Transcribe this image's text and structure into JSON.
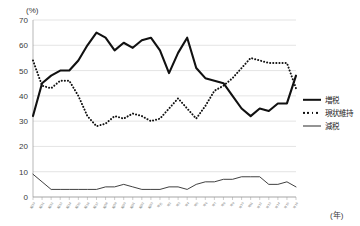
{
  "chart_data": {
    "type": "line",
    "title": "",
    "xlabel": "(年)",
    "ylabel": "(%)",
    "ylim": [
      0,
      70
    ],
    "ytick_values": [
      0,
      10,
      20,
      30,
      40,
      50,
      60,
      70
    ],
    "grid": true,
    "legend_position": "right",
    "categories": [
      "昭50",
      "昭51",
      "昭52",
      "昭53",
      "昭54",
      "昭55",
      "昭56",
      "昭57",
      "昭58",
      "昭59",
      "昭60",
      "昭61",
      "昭62",
      "昭63",
      "平元",
      "平2",
      "平3",
      "平4",
      "平5",
      "平6",
      "平7",
      "平8",
      "平9",
      "平10",
      "平11",
      "平12",
      "平13",
      "平14",
      "平15",
      "平16"
    ],
    "series": [
      {
        "name": "増税",
        "style": "thick-solid",
        "values": [
          32,
          45,
          48,
          50,
          50,
          54,
          60,
          65,
          63,
          58,
          61,
          59,
          62,
          63,
          58,
          49,
          57,
          63,
          51,
          47,
          46,
          45,
          40,
          35,
          32,
          35,
          34,
          37,
          37,
          48
        ]
      },
      {
        "name": "現状維持",
        "style": "dotted",
        "values": [
          54,
          44,
          43,
          46,
          46,
          40,
          32,
          28,
          29,
          32,
          31,
          33,
          32,
          30,
          31,
          35,
          39,
          35,
          31,
          36,
          42,
          44,
          47,
          51,
          55,
          54,
          53,
          53,
          53,
          43
        ]
      },
      {
        "name": "減税",
        "style": "thin-solid",
        "values": [
          9,
          6,
          3,
          3,
          3,
          3,
          3,
          3,
          4,
          4,
          5,
          4,
          3,
          3,
          3,
          4,
          4,
          3,
          5,
          6,
          6,
          7,
          7,
          8,
          8,
          8,
          5,
          5,
          6,
          4
        ]
      }
    ]
  },
  "legend": {
    "items": [
      {
        "label": "増税",
        "key": "thick-solid"
      },
      {
        "label": "現状維持",
        "key": "dotted"
      },
      {
        "label": "減税",
        "key": "thin-solid"
      }
    ]
  },
  "axes": {
    "y_unit": "(%)",
    "x_unit": "(年)"
  }
}
